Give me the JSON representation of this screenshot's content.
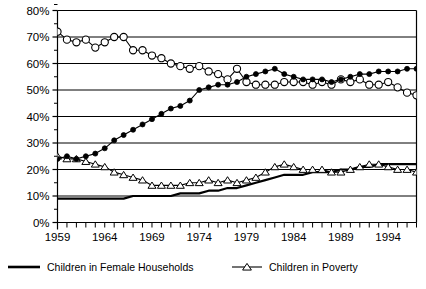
{
  "chart_data": {
    "type": "line",
    "title": "",
    "subtitle": "",
    "xlabel": "",
    "ylabel": "",
    "xlim": [
      1959,
      1997
    ],
    "ylim": [
      0,
      80
    ],
    "grid": true,
    "y_tick_labels": [
      "0%",
      "10%",
      "20%",
      "30%",
      "40%",
      "50%",
      "60%",
      "70%",
      "80%"
    ],
    "y_ticks": [
      0,
      10,
      20,
      30,
      40,
      50,
      60,
      70,
      80
    ],
    "y_minor_step": 5,
    "x_tick_labels": [
      "1959",
      "1964",
      "1969",
      "1974",
      "1979",
      "1984",
      "1989",
      "1994"
    ],
    "x_ticks": [
      1959,
      1964,
      1969,
      1974,
      1979,
      1984,
      1989,
      1994
    ],
    "x_tick_step": 1,
    "legend_position": "bottom",
    "x": [
      1959,
      1960,
      1961,
      1962,
      1963,
      1964,
      1965,
      1966,
      1967,
      1968,
      1969,
      1970,
      1971,
      1972,
      1973,
      1974,
      1975,
      1976,
      1977,
      1978,
      1979,
      1980,
      1981,
      1982,
      1983,
      1984,
      1985,
      1986,
      1987,
      1988,
      1989,
      1990,
      1991,
      1992,
      1993,
      1994,
      1995,
      1996,
      1997
    ],
    "series": [
      {
        "name": "open-circle-series",
        "marker": "open-circle",
        "values": [
          72,
          69,
          68,
          69,
          66,
          68,
          70,
          70,
          65,
          65,
          63,
          62,
          60,
          59,
          58,
          59,
          57,
          56,
          54,
          58,
          53,
          52,
          52,
          52,
          53,
          53,
          53,
          52,
          53,
          52,
          54,
          53,
          54,
          52,
          52,
          53,
          51,
          49,
          48
        ]
      },
      {
        "name": "filled-circle-series",
        "marker": "filled-circle",
        "values": [
          24,
          25,
          24,
          25,
          26,
          28,
          31,
          33,
          35,
          37,
          39,
          41,
          43,
          44,
          46,
          50,
          51,
          52,
          52,
          53,
          55,
          56,
          57,
          58,
          56,
          55,
          54,
          54,
          54,
          53,
          54,
          55,
          56,
          56,
          57,
          57,
          57,
          58,
          58
        ]
      },
      {
        "name": "Children in Poverty",
        "marker": "triangle",
        "values": [
          25,
          24,
          24,
          23,
          22,
          21,
          19,
          18,
          17,
          16,
          14,
          14,
          14,
          14,
          15,
          15,
          16,
          15,
          16,
          15,
          16,
          17,
          19,
          21,
          22,
          21,
          20,
          20,
          20,
          19,
          19,
          20,
          21,
          22,
          22,
          21,
          20,
          20,
          19
        ]
      },
      {
        "name": "Children in Female Households",
        "marker": "line",
        "values": [
          9,
          9,
          9,
          9,
          9,
          9,
          9,
          9,
          10,
          10,
          10,
          10,
          10,
          11,
          11,
          11,
          12,
          12,
          13,
          13,
          14,
          15,
          16,
          17,
          18,
          18,
          18,
          19,
          19,
          19,
          20,
          20,
          21,
          21,
          22,
          22,
          22,
          22,
          22
        ]
      }
    ],
    "legend": [
      {
        "label": "Children in Female Households",
        "marker": "thick-line"
      },
      {
        "label": "Children in Poverty",
        "marker": "triangle-line"
      }
    ],
    "colors": {
      "axis": "#000000",
      "grid": "#000000",
      "series_line": "#000000",
      "background": "#ffffff"
    }
  }
}
